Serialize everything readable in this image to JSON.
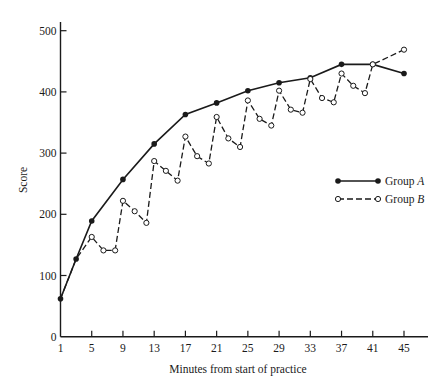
{
  "chart_data": {
    "type": "line",
    "title": "",
    "xlabel": "Minutes from start of practice",
    "ylabel": "Score",
    "xlim": [
      1,
      45
    ],
    "ylim": [
      0,
      500
    ],
    "x_ticks": [
      1,
      5,
      9,
      13,
      17,
      21,
      25,
      29,
      33,
      37,
      41,
      45
    ],
    "y_ticks": [
      0,
      100,
      200,
      300,
      400,
      500
    ],
    "grid": false,
    "legend_position": "right-middle",
    "series": [
      {
        "name": "Group A",
        "style": "solid line, filled circle markers",
        "x": [
          1,
          3,
          5,
          9,
          13,
          17,
          21,
          25,
          29,
          33,
          37,
          41,
          45
        ],
        "values": [
          62,
          127,
          189,
          257,
          315,
          363,
          382,
          402,
          415,
          423,
          445,
          445,
          430
        ]
      },
      {
        "name": "Group B",
        "style": "dashed line, open circle markers",
        "x": [
          1,
          3,
          5,
          6.5,
          8,
          9,
          10.5,
          12,
          13,
          14.5,
          16,
          17,
          18.5,
          20,
          21,
          22.5,
          24,
          25,
          26.5,
          28,
          29,
          30.5,
          32,
          33,
          34.5,
          36,
          37,
          38.5,
          40,
          41,
          45
        ],
        "values": [
          62,
          127,
          163,
          141,
          141,
          222,
          205,
          186,
          287,
          271,
          255,
          327,
          295,
          283,
          359,
          324,
          310,
          386,
          356,
          345,
          402,
          371,
          366,
          421,
          390,
          383,
          430,
          410,
          398,
          445,
          469
        ]
      }
    ]
  },
  "legend": {
    "group_a_prefix": "Group ",
    "group_a_letter": "A",
    "group_b_prefix": "Group ",
    "group_b_letter": "B"
  },
  "colors": {
    "ink": "#1a1a1a",
    "background": "#ffffff"
  }
}
